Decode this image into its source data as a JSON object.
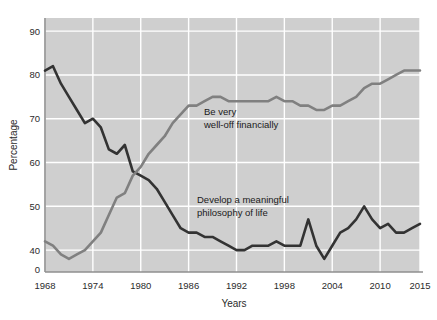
{
  "chart_data": {
    "type": "line",
    "title": "",
    "xlabel": "Years",
    "ylabel": "Percentage",
    "xlim": [
      1968,
      2015
    ],
    "ylim": [
      35,
      93
    ],
    "grid": true,
    "legend_position": "inline-annotations",
    "xticks": [
      1968,
      1974,
      1980,
      1986,
      1992,
      1998,
      2004,
      2010,
      2015
    ],
    "yticks": [
      0,
      40,
      50,
      60,
      70,
      80,
      90
    ],
    "y_axis_break": true,
    "y_axis_break_note": "Axis is broken between 0 and 40",
    "background_color": "#cfcfcf",
    "gridline_color": "#ffffff",
    "series": [
      {
        "name": "Develop a meaningful philosophy of life",
        "color": "#333333",
        "annotation": "Develop a meaningful\nphilosophy of life",
        "annotation_line1": "Develop a meaningful",
        "annotation_line2": "philosophy of life",
        "x": [
          1968,
          1969,
          1970,
          1971,
          1972,
          1973,
          1974,
          1975,
          1976,
          1977,
          1978,
          1979,
          1980,
          1981,
          1982,
          1983,
          1984,
          1985,
          1986,
          1987,
          1988,
          1989,
          1990,
          1991,
          1992,
          1993,
          1994,
          1995,
          1996,
          1997,
          1998,
          1999,
          2000,
          2001,
          2002,
          2003,
          2004,
          2005,
          2006,
          2007,
          2008,
          2009,
          2010,
          2011,
          2012,
          2013,
          2014,
          2015
        ],
        "values": [
          81,
          82,
          78,
          75,
          72,
          69,
          70,
          68,
          63,
          62,
          64,
          58,
          57,
          56,
          54,
          51,
          48,
          45,
          44,
          44,
          43,
          43,
          42,
          41,
          40,
          40,
          41,
          41,
          41,
          42,
          41,
          41,
          41,
          47,
          41,
          38,
          41,
          44,
          45,
          47,
          50,
          47,
          45,
          46,
          44,
          44,
          45,
          46
        ]
      },
      {
        "name": "Be very well-off financially",
        "color": "#808080",
        "annotation": "Be very\nwell-off financially",
        "annotation_line1": "Be very",
        "annotation_line2": "well-off financially",
        "x": [
          1968,
          1969,
          1970,
          1971,
          1972,
          1973,
          1974,
          1975,
          1976,
          1977,
          1978,
          1979,
          1980,
          1981,
          1982,
          1983,
          1984,
          1985,
          1986,
          1987,
          1988,
          1989,
          1990,
          1991,
          1992,
          1993,
          1994,
          1995,
          1996,
          1997,
          1998,
          1999,
          2000,
          2001,
          2002,
          2003,
          2004,
          2005,
          2006,
          2007,
          2008,
          2009,
          2010,
          2011,
          2012,
          2013,
          2014,
          2015
        ],
        "values": [
          42,
          41,
          39,
          38,
          39,
          40,
          42,
          44,
          48,
          52,
          53,
          57,
          59,
          62,
          64,
          66,
          69,
          71,
          73,
          73,
          74,
          75,
          75,
          74,
          74,
          74,
          74,
          74,
          74,
          75,
          74,
          74,
          73,
          73,
          72,
          72,
          73,
          73,
          74,
          75,
          77,
          78,
          78,
          79,
          80,
          81,
          81,
          81
        ]
      }
    ]
  },
  "axes": {
    "y_label": "Percentage",
    "x_label": "Years",
    "y_tick_labels": [
      "90",
      "80",
      "70",
      "60",
      "50",
      "40",
      "0"
    ],
    "x_tick_labels": [
      "1968",
      "1974",
      "1980",
      "1986",
      "1992",
      "1998",
      "2004",
      "2010",
      "2015"
    ]
  },
  "annotations": {
    "gray_line_1": "Be very",
    "gray_line_2": "well-off financially",
    "dark_line_1": "Develop a meaningful",
    "dark_line_2": "philosophy of life"
  }
}
